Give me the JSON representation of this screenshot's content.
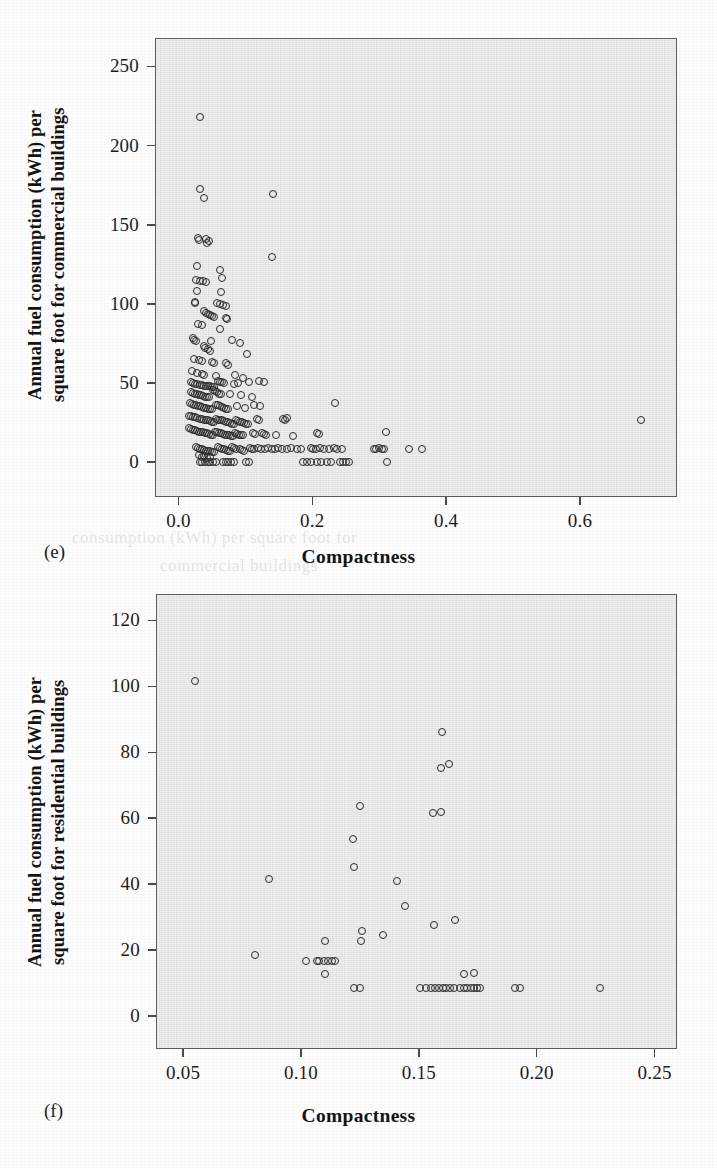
{
  "figure": {
    "panels": [
      {
        "letter": "(e)",
        "xlabel": "Compactness",
        "ylabel": "Annual fuel consumption (kWh) per\nsquare foot for commercial buildings"
      },
      {
        "letter": "(f)",
        "xlabel": "Compactness",
        "ylabel": "Annual fuel consumption (kWh) per\nsquare foot for residential buildings"
      }
    ],
    "ghost_text": [
      "consumption (kWh) per square foot for",
      "commercial buildings"
    ]
  },
  "colors": {
    "plot_background": "#e9e9e9",
    "frame": "#5d5d5d",
    "marker": "#2b2b2b",
    "text": "#1a1a1a",
    "page_background": "#fdfdfd"
  },
  "chart_data": [
    {
      "type": "scatter",
      "title": "",
      "panel": "(e)",
      "xlabel": "Compactness",
      "ylabel": "Annual fuel consumption (kWh) per square foot for commercial buildings",
      "xlim": [
        -0.035,
        0.745
      ],
      "ylim": [
        -22,
        268
      ],
      "xticks": [
        0.0,
        0.2,
        0.4,
        0.6
      ],
      "xticklabels": [
        "0.0",
        "0.2",
        "0.4",
        "0.6"
      ],
      "yticks": [
        0,
        50,
        100,
        150,
        200,
        250
      ],
      "yticklabels": [
        "0",
        "50",
        "100",
        "150",
        "200",
        "250"
      ],
      "grid": false,
      "legend": null,
      "marker": "open-circle",
      "n_points": 286,
      "points": [
        [
          0.031,
          219.0
        ],
        [
          0.03,
          173.0
        ],
        [
          0.036,
          167.5
        ],
        [
          0.14,
          170.0
        ],
        [
          0.139,
          130.0
        ],
        [
          0.028,
          142.0
        ],
        [
          0.029,
          141.0
        ],
        [
          0.039,
          141.5
        ],
        [
          0.044,
          140.5
        ],
        [
          0.041,
          139.0
        ],
        [
          0.026,
          124.5
        ],
        [
          0.06,
          122.0
        ],
        [
          0.064,
          117.0
        ],
        [
          0.025,
          115.5
        ],
        [
          0.03,
          115.0
        ],
        [
          0.035,
          115.0
        ],
        [
          0.04,
          114.5
        ],
        [
          0.026,
          109.0
        ],
        [
          0.062,
          108.0
        ],
        [
          0.023,
          102.0
        ],
        [
          0.024,
          101.0
        ],
        [
          0.056,
          101.0
        ],
        [
          0.06,
          100.5
        ],
        [
          0.065,
          100.0
        ],
        [
          0.07,
          99.0
        ],
        [
          0.037,
          96.0
        ],
        [
          0.04,
          95.0
        ],
        [
          0.043,
          94.0
        ],
        [
          0.046,
          93.5
        ],
        [
          0.049,
          93.0
        ],
        [
          0.052,
          92.5
        ],
        [
          0.069,
          92.0
        ],
        [
          0.071,
          91.0
        ],
        [
          0.028,
          88.0
        ],
        [
          0.033,
          87.0
        ],
        [
          0.061,
          85.0
        ],
        [
          0.02,
          79.0
        ],
        [
          0.022,
          78.0
        ],
        [
          0.025,
          77.0
        ],
        [
          0.047,
          77.0
        ],
        [
          0.078,
          78.0
        ],
        [
          0.09,
          76.0
        ],
        [
          0.036,
          74.0
        ],
        [
          0.038,
          73.0
        ],
        [
          0.042,
          72.0
        ],
        [
          0.045,
          71.0
        ],
        [
          0.101,
          69.0
        ],
        [
          0.022,
          66.0
        ],
        [
          0.029,
          65.0
        ],
        [
          0.033,
          64.5
        ],
        [
          0.048,
          64.0
        ],
        [
          0.052,
          63.5
        ],
        [
          0.07,
          63.0
        ],
        [
          0.073,
          62.0
        ],
        [
          0.019,
          58.0
        ],
        [
          0.026,
          57.0
        ],
        [
          0.034,
          56.5
        ],
        [
          0.037,
          56.0
        ],
        [
          0.055,
          55.0
        ],
        [
          0.083,
          55.5
        ],
        [
          0.095,
          54.0
        ],
        [
          0.018,
          51.0
        ],
        [
          0.021,
          50.5
        ],
        [
          0.024,
          50.0
        ],
        [
          0.027,
          50.0
        ],
        [
          0.03,
          49.5
        ],
        [
          0.033,
          49.5
        ],
        [
          0.036,
          49.0
        ],
        [
          0.039,
          49.0
        ],
        [
          0.042,
          48.5
        ],
        [
          0.045,
          48.5
        ],
        [
          0.048,
          48.0
        ],
        [
          0.051,
          48.0
        ],
        [
          0.057,
          52.0
        ],
        [
          0.06,
          51.5
        ],
        [
          0.063,
          51.0
        ],
        [
          0.066,
          50.5
        ],
        [
          0.082,
          50.0
        ],
        [
          0.087,
          50.5
        ],
        [
          0.104,
          51.5
        ],
        [
          0.119,
          52.0
        ],
        [
          0.126,
          51.0
        ],
        [
          0.017,
          45.0
        ],
        [
          0.02,
          44.5
        ],
        [
          0.023,
          44.0
        ],
        [
          0.026,
          43.5
        ],
        [
          0.029,
          43.0
        ],
        [
          0.032,
          43.0
        ],
        [
          0.035,
          42.5
        ],
        [
          0.038,
          42.0
        ],
        [
          0.041,
          42.0
        ],
        [
          0.044,
          41.5
        ],
        [
          0.05,
          46.0
        ],
        [
          0.053,
          45.5
        ],
        [
          0.056,
          45.0
        ],
        [
          0.059,
          44.0
        ],
        [
          0.062,
          43.5
        ],
        [
          0.076,
          44.0
        ],
        [
          0.092,
          43.0
        ],
        [
          0.108,
          42.0
        ],
        [
          0.016,
          38.0
        ],
        [
          0.019,
          37.5
        ],
        [
          0.022,
          37.0
        ],
        [
          0.025,
          36.5
        ],
        [
          0.028,
          36.0
        ],
        [
          0.031,
          36.0
        ],
        [
          0.034,
          35.5
        ],
        [
          0.037,
          35.0
        ],
        [
          0.04,
          35.0
        ],
        [
          0.043,
          34.5
        ],
        [
          0.046,
          34.0
        ],
        [
          0.049,
          34.0
        ],
        [
          0.055,
          37.0
        ],
        [
          0.058,
          36.5
        ],
        [
          0.061,
          36.0
        ],
        [
          0.064,
          35.5
        ],
        [
          0.067,
          35.0
        ],
        [
          0.07,
          34.5
        ],
        [
          0.073,
          34.0
        ],
        [
          0.086,
          36.0
        ],
        [
          0.098,
          35.0
        ],
        [
          0.112,
          37.0
        ],
        [
          0.121,
          36.0
        ],
        [
          0.232,
          38.0
        ],
        [
          0.015,
          30.0
        ],
        [
          0.018,
          29.5
        ],
        [
          0.021,
          29.0
        ],
        [
          0.024,
          29.0
        ],
        [
          0.027,
          28.5
        ],
        [
          0.03,
          28.0
        ],
        [
          0.033,
          28.0
        ],
        [
          0.036,
          27.5
        ],
        [
          0.039,
          27.0
        ],
        [
          0.042,
          27.0
        ],
        [
          0.045,
          26.5
        ],
        [
          0.048,
          26.0
        ],
        [
          0.051,
          26.0
        ],
        [
          0.054,
          28.0
        ],
        [
          0.057,
          27.5
        ],
        [
          0.06,
          27.0
        ],
        [
          0.063,
          27.0
        ],
        [
          0.066,
          26.5
        ],
        [
          0.069,
          26.0
        ],
        [
          0.072,
          26.0
        ],
        [
          0.075,
          25.5
        ],
        [
          0.078,
          25.0
        ],
        [
          0.081,
          25.0
        ],
        [
          0.084,
          27.0
        ],
        [
          0.087,
          26.5
        ],
        [
          0.09,
          26.0
        ],
        [
          0.093,
          26.0
        ],
        [
          0.096,
          25.5
        ],
        [
          0.099,
          25.0
        ],
        [
          0.102,
          25.0
        ],
        [
          0.116,
          28.0
        ],
        [
          0.119,
          27.5
        ],
        [
          0.155,
          28.0
        ],
        [
          0.158,
          27.5
        ],
        [
          0.161,
          28.5
        ],
        [
          0.689,
          27.5
        ],
        [
          0.014,
          22.0
        ],
        [
          0.017,
          21.5
        ],
        [
          0.02,
          21.0
        ],
        [
          0.023,
          21.0
        ],
        [
          0.026,
          20.5
        ],
        [
          0.029,
          20.0
        ],
        [
          0.032,
          20.0
        ],
        [
          0.035,
          19.5
        ],
        [
          0.038,
          19.0
        ],
        [
          0.041,
          19.0
        ],
        [
          0.044,
          18.5
        ],
        [
          0.047,
          18.0
        ],
        [
          0.05,
          18.0
        ],
        [
          0.053,
          20.0
        ],
        [
          0.056,
          19.5
        ],
        [
          0.059,
          19.0
        ],
        [
          0.062,
          19.0
        ],
        [
          0.065,
          18.5
        ],
        [
          0.068,
          18.0
        ],
        [
          0.071,
          18.0
        ],
        [
          0.074,
          17.5
        ],
        [
          0.077,
          17.0
        ],
        [
          0.08,
          17.0
        ],
        [
          0.083,
          19.0
        ],
        [
          0.086,
          18.5
        ],
        [
          0.089,
          18.0
        ],
        [
          0.092,
          18.0
        ],
        [
          0.095,
          17.5
        ],
        [
          0.11,
          19.0
        ],
        [
          0.113,
          18.5
        ],
        [
          0.124,
          19.0
        ],
        [
          0.127,
          18.5
        ],
        [
          0.13,
          18.0
        ],
        [
          0.144,
          18.0
        ],
        [
          0.17,
          17.0
        ],
        [
          0.205,
          19.0
        ],
        [
          0.208,
          18.5
        ],
        [
          0.308,
          19.5
        ],
        [
          0.025,
          10.0
        ],
        [
          0.028,
          9.5
        ],
        [
          0.031,
          9.0
        ],
        [
          0.034,
          9.0
        ],
        [
          0.037,
          8.5
        ],
        [
          0.04,
          8.0
        ],
        [
          0.043,
          8.0
        ],
        [
          0.046,
          7.5
        ],
        [
          0.049,
          7.0
        ],
        [
          0.052,
          7.0
        ],
        [
          0.057,
          10.0
        ],
        [
          0.06,
          9.5
        ],
        [
          0.063,
          9.0
        ],
        [
          0.066,
          9.0
        ],
        [
          0.069,
          8.5
        ],
        [
          0.072,
          8.0
        ],
        [
          0.075,
          8.0
        ],
        [
          0.078,
          10.0
        ],
        [
          0.081,
          9.5
        ],
        [
          0.084,
          9.0
        ],
        [
          0.09,
          9.0
        ],
        [
          0.093,
          8.5
        ],
        [
          0.096,
          8.0
        ],
        [
          0.105,
          9.5
        ],
        [
          0.108,
          9.0
        ],
        [
          0.112,
          9.0
        ],
        [
          0.118,
          9.5
        ],
        [
          0.122,
          9.0
        ],
        [
          0.128,
          9.0
        ],
        [
          0.133,
          9.5
        ],
        [
          0.138,
          9.0
        ],
        [
          0.143,
          9.0
        ],
        [
          0.148,
          9.5
        ],
        [
          0.153,
          9.0
        ],
        [
          0.16,
          9.0
        ],
        [
          0.166,
          9.5
        ],
        [
          0.175,
          9.0
        ],
        [
          0.182,
          9.0
        ],
        [
          0.196,
          9.5
        ],
        [
          0.2,
          9.0
        ],
        [
          0.204,
          9.0
        ],
        [
          0.21,
          9.5
        ],
        [
          0.216,
          9.0
        ],
        [
          0.223,
          9.0
        ],
        [
          0.231,
          9.5
        ],
        [
          0.236,
          9.0
        ],
        [
          0.243,
          9.0
        ],
        [
          0.29,
          9.0
        ],
        [
          0.294,
          9.0
        ],
        [
          0.298,
          9.5
        ],
        [
          0.302,
          9.0
        ],
        [
          0.306,
          9.0
        ],
        [
          0.343,
          9.0
        ],
        [
          0.363,
          9.0
        ],
        [
          0.03,
          1.0
        ],
        [
          0.034,
          0.5
        ],
        [
          0.038,
          1.0
        ],
        [
          0.042,
          0.5
        ],
        [
          0.046,
          1.0
        ],
        [
          0.05,
          0.5
        ],
        [
          0.054,
          1.0
        ],
        [
          0.065,
          0.5
        ],
        [
          0.069,
          1.0
        ],
        [
          0.073,
          0.5
        ],
        [
          0.077,
          1.0
        ],
        [
          0.081,
          0.5
        ],
        [
          0.1,
          0.5
        ],
        [
          0.104,
          1.0
        ],
        [
          0.185,
          0.5
        ],
        [
          0.19,
          1.0
        ],
        [
          0.196,
          0.5
        ],
        [
          0.206,
          1.0
        ],
        [
          0.211,
          0.5
        ],
        [
          0.22,
          1.0
        ],
        [
          0.226,
          0.5
        ],
        [
          0.24,
          1.0
        ],
        [
          0.245,
          0.5
        ],
        [
          0.249,
          1.0
        ],
        [
          0.253,
          0.5
        ],
        [
          0.31,
          1.0
        ],
        [
          0.029,
          5.0
        ],
        [
          0.033,
          4.0
        ],
        [
          0.037,
          4.5
        ],
        [
          0.041,
          3.5
        ],
        [
          0.045,
          4.0
        ]
      ]
    },
    {
      "type": "scatter",
      "title": "",
      "panel": "(f)",
      "xlabel": "Compactness",
      "ylabel": "Annual fuel consumption (kWh) per square foot for residential buildings",
      "xlim": [
        0.0385,
        0.2595
      ],
      "ylim": [
        -10,
        128
      ],
      "xticks": [
        0.05,
        0.1,
        0.15,
        0.2,
        0.25
      ],
      "xticklabels": [
        "0.05",
        "0.10",
        "0.15",
        "0.20",
        "0.25"
      ],
      "yticks": [
        0,
        20,
        40,
        60,
        80,
        100,
        120
      ],
      "yticklabels": [
        "0",
        "20",
        "40",
        "60",
        "80",
        "100",
        "120"
      ],
      "grid": false,
      "legend": null,
      "marker": "open-circle",
      "n_points": 58,
      "points": [
        [
          0.0545,
          101.8
        ],
        [
          0.1595,
          86.3
        ],
        [
          0.1588,
          75.5
        ],
        [
          0.1625,
          76.8
        ],
        [
          0.1248,
          64.0
        ],
        [
          0.1555,
          62.0
        ],
        [
          0.1588,
          62.2
        ],
        [
          0.1218,
          54.0
        ],
        [
          0.1222,
          45.5
        ],
        [
          0.0858,
          42.0
        ],
        [
          0.1405,
          41.3
        ],
        [
          0.1438,
          33.8
        ],
        [
          0.1648,
          29.5
        ],
        [
          0.1562,
          28.0
        ],
        [
          0.1255,
          26.0
        ],
        [
          0.1345,
          25.0
        ],
        [
          0.1252,
          23.2
        ],
        [
          0.1098,
          23.0
        ],
        [
          0.08,
          18.8
        ],
        [
          0.1018,
          17.0
        ],
        [
          0.1062,
          17.0
        ],
        [
          0.1072,
          17.0
        ],
        [
          0.1092,
          17.0
        ],
        [
          0.1112,
          17.0
        ],
        [
          0.1128,
          17.0
        ],
        [
          0.1142,
          17.0
        ],
        [
          0.1098,
          13.2
        ],
        [
          0.1688,
          13.2
        ],
        [
          0.1728,
          13.3
        ],
        [
          0.1222,
          8.9
        ],
        [
          0.1248,
          8.9
        ],
        [
          0.1502,
          8.9
        ],
        [
          0.1525,
          8.9
        ],
        [
          0.1548,
          8.9
        ],
        [
          0.1565,
          8.9
        ],
        [
          0.1582,
          8.9
        ],
        [
          0.1598,
          8.9
        ],
        [
          0.1612,
          8.9
        ],
        [
          0.1628,
          8.9
        ],
        [
          0.1645,
          8.9
        ],
        [
          0.1672,
          8.9
        ],
        [
          0.1688,
          8.9
        ],
        [
          0.1702,
          8.9
        ],
        [
          0.1715,
          8.9
        ],
        [
          0.1728,
          8.9
        ],
        [
          0.1742,
          8.9
        ],
        [
          0.1755,
          8.9
        ],
        [
          0.1902,
          8.9
        ],
        [
          0.1925,
          8.9
        ],
        [
          0.2265,
          8.9
        ]
      ]
    }
  ]
}
